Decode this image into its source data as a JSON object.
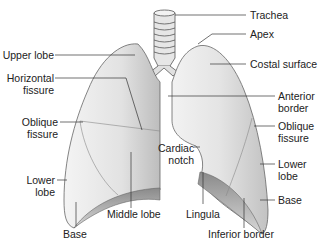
{
  "figure": {
    "labels": {
      "trachea": "Trachea",
      "apex": "Apex",
      "costal_surface": "Costal surface",
      "anterior_border_1": "Anterior",
      "anterior_border_2": "border",
      "oblique_fissure_right_1": "Oblique",
      "oblique_fissure_right_2": "fissure",
      "lower_lobe_right_1": "Lower",
      "lower_lobe_right_2": "lobe",
      "base_right": "Base",
      "inferior_border": "Inferior border",
      "lingula": "Lingula",
      "cardiac_notch_1": "Cardiac",
      "cardiac_notch_2": "notch",
      "upper_lobe": "Upper lobe",
      "horizontal_fissure_1": "Horizontal",
      "horizontal_fissure_2": "fissure",
      "oblique_fissure_left_1": "Oblique",
      "oblique_fissure_left_2": "fissure",
      "lower_lobe_left_1": "Lower",
      "lower_lobe_left_2": "lobe",
      "middle_lobe": "Middle lobe",
      "base_left": "Base"
    },
    "colors": {
      "lung_fill": "#e4e4e4",
      "lung_shade": "#9a9a9a",
      "outline": "#555555",
      "leader": "#333333"
    }
  }
}
